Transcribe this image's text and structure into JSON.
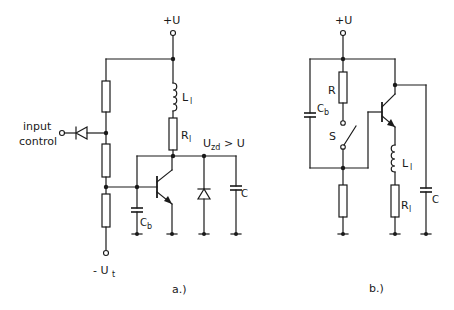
{
  "figure": {
    "panel_a": {
      "caption": "a.)",
      "supply_label": "+U",
      "neg_supply_label": "- U",
      "neg_supply_sub": "t",
      "input_label_line1": "input",
      "input_label_line2": "control",
      "inductor_label": "L",
      "inductor_sub": "l",
      "resistor_label": "R",
      "resistor_sub": "l",
      "voltage_label": "U",
      "voltage_sub": "zd",
      "voltage_cond": "> U",
      "base_cap_label": "C",
      "base_cap_sub": "b",
      "cap_label": "C",
      "components": [
        "voltage-divider-resistor-top",
        "voltage-divider-resistor-middle",
        "voltage-divider-resistor-bottom",
        "input-diode",
        "inductor-Ll",
        "resistor-Rl",
        "npn-transistor",
        "base-capacitor-Cb",
        "zener-diode",
        "capacitor-C"
      ]
    },
    "panel_b": {
      "caption": "b.)",
      "supply_label": "+U",
      "resistor_label": "R",
      "base_cap_label": "C",
      "base_cap_sub": "b",
      "switch_label": "S",
      "inductor_label": "L",
      "inductor_sub": "l",
      "load_res_label": "R",
      "load_res_sub": "l",
      "cap_label": "C",
      "components": [
        "resistor-R",
        "base-capacitor-Cb",
        "switch-S",
        "npn-transistor",
        "bottom-resistor",
        "inductor-Ll",
        "resistor-Rl",
        "capacitor-C"
      ]
    }
  }
}
